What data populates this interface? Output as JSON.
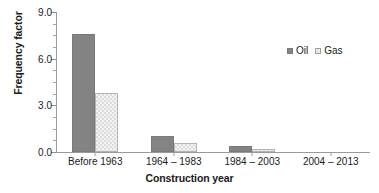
{
  "chart_data": {
    "type": "bar",
    "title": "",
    "xlabel": "Construction year",
    "ylabel": "Frequency factor",
    "categories": [
      "Before 1963",
      "1964 – 1983",
      "1984 – 2003",
      "2004 – 2013"
    ],
    "series": [
      {
        "name": "Oil",
        "values": [
          7.6,
          1.0,
          0.4,
          0.0
        ],
        "color": "#838383",
        "swatch": "filled-square"
      },
      {
        "name": "Gas",
        "values": [
          3.8,
          0.55,
          0.2,
          0.0
        ],
        "color": "#e8e8e8",
        "swatch": "hatched-square"
      }
    ],
    "ylim": [
      0.0,
      9.0
    ],
    "ytick_labels": [
      "0.0",
      "3.0",
      "6.0",
      "9.0"
    ],
    "ytick_values": [
      0.0,
      3.0,
      6.0,
      9.0
    ],
    "yminor_step": 0.75,
    "grid": false,
    "legend_position": "top-right",
    "legend_entries": [
      "Oil",
      "Gas"
    ]
  }
}
